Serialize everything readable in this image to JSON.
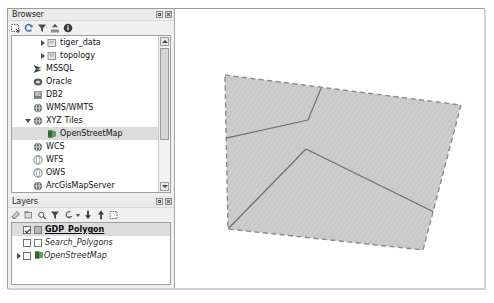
{
  "browser_panel": {
    "title": "Browser",
    "title_buttons": [
      {
        "name": "float-button",
        "icon": "float-icon"
      },
      {
        "name": "close-button",
        "icon": "close-icon"
      }
    ],
    "toolbar": [
      {
        "name": "add-selected-layers",
        "icon": "add-layer-icon"
      },
      {
        "name": "refresh",
        "icon": "refresh-icon"
      },
      {
        "name": "filter-browser",
        "icon": "filter-icon"
      },
      {
        "name": "collapse-all",
        "icon": "collapse-all-icon"
      },
      {
        "name": "properties",
        "icon": "info-icon"
      }
    ],
    "tree": [
      {
        "label": "tiger_data",
        "indent": 2,
        "expander": "closed",
        "icon": "schema-icon",
        "selected": false
      },
      {
        "label": "topology",
        "indent": 2,
        "expander": "closed",
        "icon": "schema-icon",
        "selected": false
      },
      {
        "label": "MSSQL",
        "indent": 1,
        "expander": "none",
        "icon": "mssql-icon",
        "selected": false
      },
      {
        "label": "Oracle",
        "indent": 1,
        "expander": "none",
        "icon": "oracle-icon",
        "selected": false
      },
      {
        "label": "DB2",
        "indent": 1,
        "expander": "none",
        "icon": "db2-icon",
        "selected": false
      },
      {
        "label": "WMS/WMTS",
        "indent": 1,
        "expander": "none",
        "icon": "wms-icon",
        "selected": false
      },
      {
        "label": "XYZ Tiles",
        "indent": 1,
        "expander": "open",
        "icon": "xyz-icon",
        "selected": false
      },
      {
        "label": "OpenStreetMap",
        "indent": 2,
        "expander": "none",
        "icon": "osm-layer-icon",
        "selected": true
      },
      {
        "label": "WCS",
        "indent": 1,
        "expander": "none",
        "icon": "wcs-icon",
        "selected": false
      },
      {
        "label": "WFS",
        "indent": 1,
        "expander": "none",
        "icon": "wfs-icon",
        "selected": false
      },
      {
        "label": "OWS",
        "indent": 1,
        "expander": "none",
        "icon": "ows-icon",
        "selected": false
      },
      {
        "label": "ArcGisMapServer",
        "indent": 1,
        "expander": "none",
        "icon": "arcgis-map-icon",
        "selected": false
      },
      {
        "label": "ArcGisFeatureServer",
        "indent": 1,
        "expander": "none",
        "icon": "arcgis-feature-icon",
        "selected": false
      },
      {
        "label": "GeoNode",
        "indent": 1,
        "expander": "none",
        "icon": "geonode-icon",
        "selected": false
      }
    ],
    "scrollbar": {
      "name": "browser-vertical-scrollbar"
    }
  },
  "layers_panel": {
    "title": "Layers",
    "title_buttons": [
      {
        "name": "float-button",
        "icon": "float-icon"
      },
      {
        "name": "close-button",
        "icon": "close-icon"
      }
    ],
    "toolbar": [
      {
        "name": "open-layer-styling",
        "icon": "styling-panel-icon"
      },
      {
        "name": "add-group",
        "icon": "add-group-icon"
      },
      {
        "name": "manage-layer-visibility",
        "icon": "visibility-icon"
      },
      {
        "name": "filter-legend",
        "icon": "filter-icon"
      },
      {
        "name": "filter-legend-expression",
        "icon": "filter-expression-icon"
      },
      {
        "name": "expand-all",
        "icon": "expand-all-icon"
      },
      {
        "name": "collapse-all",
        "icon": "collapse-all-icon"
      },
      {
        "name": "remove-layer",
        "icon": "remove-layer-icon"
      }
    ],
    "layers": [
      {
        "label": "GDP_Polygon",
        "checked": true,
        "style": "active",
        "swatch": "fill-gray",
        "expander": "none",
        "selected": true,
        "icon": "polygon-swatch-icon"
      },
      {
        "label": "Search_Polygons",
        "checked": false,
        "style": "inactive",
        "swatch": "fill-white",
        "expander": "none",
        "selected": false,
        "icon": "polygon-swatch-icon"
      },
      {
        "label": "OpenStreetMap",
        "checked": false,
        "style": "inactive",
        "swatch": "raster",
        "expander": "closed",
        "selected": false,
        "icon": "raster-layer-icon"
      }
    ]
  },
  "map": {
    "name": "map-canvas",
    "colors": {
      "polygon_fill": "#c9c9c9",
      "polygon_boundary": "#8a8a8a",
      "interior_line": "#6e6e6e",
      "canvas_background": "#ffffff"
    },
    "features": {
      "outer_boundary": [
        [
          49,
          66
        ],
        [
          285,
          96
        ],
        [
          247,
          241
        ],
        [
          52,
          220
        ]
      ],
      "interior_lines": [
        [
          [
            132,
            111
          ],
          [
            -22,
            145
          ]
        ],
        [
          [
            132,
            111
          ],
          [
            160,
            43
          ]
        ],
        [
          [
            130,
            140
          ],
          [
            52,
            220
          ]
        ],
        [
          [
            130,
            140
          ],
          [
            262,
            205
          ]
        ]
      ],
      "node_points": [
        [
          132,
          111
        ],
        [
          130,
          140
        ]
      ]
    }
  }
}
